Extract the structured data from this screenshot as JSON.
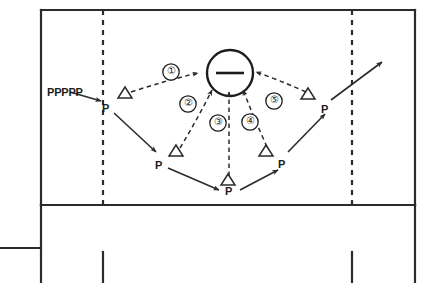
{
  "diagram": {
    "colors": {
      "line": "#2b2b2b",
      "dashed": "#2b2b2b",
      "text": "#1c1c1c",
      "background": "#ffffff"
    },
    "group_label": {
      "text": "PPPPP",
      "name": "player-queue-label"
    },
    "ball": {
      "symbol": "—",
      "name": "ball-marker"
    },
    "players": [
      {
        "id": "p1",
        "label": "P",
        "x": 108,
        "y": 103,
        "cone": {
          "x": 125,
          "y": 93
        }
      },
      {
        "id": "p2",
        "label": "P",
        "x": 160,
        "y": 160,
        "cone": {
          "x": 176,
          "y": 151
        }
      },
      {
        "id": "p3",
        "label": "P",
        "x": 228,
        "y": 191,
        "cone": {
          "x": 228,
          "y": 180
        }
      },
      {
        "id": "p4",
        "label": "P",
        "x": 281,
        "y": 160,
        "cone": {
          "x": 266,
          "y": 151
        }
      },
      {
        "id": "p5",
        "label": "P",
        "x": 325,
        "y": 104,
        "cone": {
          "x": 308,
          "y": 94
        }
      }
    ],
    "steps": [
      {
        "number": "①",
        "x": 171,
        "y": 72,
        "name": "step-marker-1"
      },
      {
        "number": "②",
        "x": 188,
        "y": 104,
        "name": "step-marker-2"
      },
      {
        "number": "③",
        "x": 218,
        "y": 123,
        "name": "step-marker-3"
      },
      {
        "number": "④",
        "x": 250,
        "y": 122,
        "name": "step-marker-4"
      },
      {
        "number": "⑤",
        "x": 274,
        "y": 101,
        "name": "step-marker-5"
      }
    ]
  }
}
